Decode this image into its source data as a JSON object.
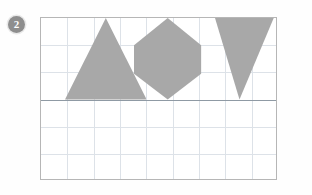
{
  "marker": {
    "label": "2",
    "style": "circled-number",
    "color": "#8e8e8e",
    "text_color": "#ffffff"
  },
  "plot": {
    "frame": {
      "x": 40,
      "y": 17,
      "width": 237,
      "height": 163,
      "border_color": "#b6b6b6"
    },
    "grid": {
      "columns": 9,
      "rows": 6,
      "line_color": "#dde2e8",
      "cell_width": 26.3,
      "cell_height": 27.0,
      "visible": true
    },
    "axis": {
      "type": "horizontal-baseline",
      "y": 79,
      "color": "#8f9aa4",
      "rows_above": 3,
      "rows_below": 3
    },
    "shape_fill": "#a8a8a8"
  },
  "chart_data": {
    "type": "scatter",
    "title": "",
    "xlabel": "",
    "ylabel": "",
    "grid": true,
    "legend": null,
    "xlim": [
      0,
      9
    ],
    "ylim": [
      -3,
      3
    ],
    "annotations": [
      "2"
    ],
    "shapes": [
      {
        "name": "upright-triangle",
        "kind": "triangle",
        "orientation": "apex-up",
        "fill": "#a8a8a8",
        "points": [
          [
            2.45,
            3.0
          ],
          [
            0.9,
            0.0
          ],
          [
            4.0,
            0.0
          ]
        ],
        "apex": [
          2.45,
          3.0
        ],
        "base_y": 0.0,
        "base_width_cells": 3.1,
        "height_cells": 3.0,
        "sits_on_axis": true
      },
      {
        "name": "hexagon",
        "kind": "hexagon",
        "orientation": "point-up-down",
        "fill": "#a8a8a8",
        "points": [
          [
            4.83,
            3.0
          ],
          [
            6.1,
            2.0
          ],
          [
            6.1,
            0.95
          ],
          [
            4.83,
            0.0
          ],
          [
            3.55,
            0.95
          ],
          [
            3.55,
            2.0
          ]
        ],
        "top_vertex": [
          4.83,
          3.0
        ],
        "bottom_vertex": [
          4.83,
          0.0
        ],
        "width_cells": 2.55,
        "height_cells": 3.0,
        "sits_on_axis": true
      },
      {
        "name": "inverted-triangle",
        "kind": "triangle",
        "orientation": "apex-down",
        "fill": "#a8a8a8",
        "points": [
          [
            6.62,
            3.0
          ],
          [
            8.85,
            3.0
          ],
          [
            7.55,
            0.0
          ]
        ],
        "apex": [
          7.55,
          0.0
        ],
        "top_y": 3.0,
        "top_width_cells": 2.23,
        "height_cells": 3.0,
        "sits_on_axis": true
      }
    ]
  }
}
